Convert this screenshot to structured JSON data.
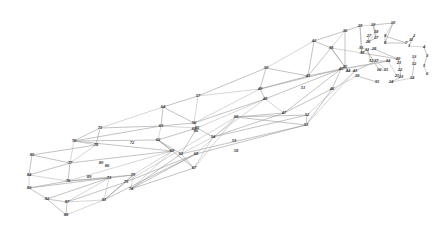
{
  "figure": {
    "background_color": "#ffffff",
    "line_color": "#9a9a9a",
    "label_color": "#2b2b2b"
  },
  "chart_data": {
    "type": "scatter",
    "xlabel": "",
    "ylabel": "",
    "grid": false,
    "legend": "none",
    "xlim": [
      0,
      433
    ],
    "ylim": [
      0,
      236
    ],
    "nodes": [
      {
        "id": "1",
        "x": 409,
        "y": 46
      },
      {
        "id": "2",
        "x": 414,
        "y": 36
      },
      {
        "id": "3",
        "x": 427,
        "y": 56
      },
      {
        "id": "4",
        "x": 424,
        "y": 47
      },
      {
        "id": "5",
        "x": 424,
        "y": 66
      },
      {
        "id": "6",
        "x": 427,
        "y": 74
      },
      {
        "id": "7",
        "x": 406,
        "y": 43
      },
      {
        "id": "8",
        "x": 385,
        "y": 43
      },
      {
        "id": "9",
        "x": 385,
        "y": 36
      },
      {
        "id": "10",
        "x": 393,
        "y": 23
      },
      {
        "id": "11",
        "x": 411,
        "y": 40
      },
      {
        "id": "12",
        "x": 414,
        "y": 64
      },
      {
        "id": "13",
        "x": 414,
        "y": 57
      },
      {
        "id": "14",
        "x": 412,
        "y": 78
      },
      {
        "id": "15",
        "x": 386,
        "y": 70
      },
      {
        "id": "16",
        "x": 379,
        "y": 70
      },
      {
        "id": "17",
        "x": 376,
        "y": 38
      },
      {
        "id": "18",
        "x": 376,
        "y": 32
      },
      {
        "id": "19",
        "x": 373,
        "y": 25
      },
      {
        "id": "20",
        "x": 398,
        "y": 59
      },
      {
        "id": "21",
        "x": 399,
        "y": 63
      },
      {
        "id": "22",
        "x": 400,
        "y": 70
      },
      {
        "id": "23",
        "x": 401,
        "y": 77
      },
      {
        "id": "24",
        "x": 391,
        "y": 82
      },
      {
        "id": "25",
        "x": 397,
        "y": 76
      },
      {
        "id": "26",
        "x": 368,
        "y": 42
      },
      {
        "id": "27",
        "x": 369,
        "y": 36
      },
      {
        "id": "28",
        "x": 374,
        "y": 49
      },
      {
        "id": "29",
        "x": 360,
        "y": 26
      },
      {
        "id": "30",
        "x": 362,
        "y": 53
      },
      {
        "id": "31",
        "x": 367,
        "y": 50
      },
      {
        "id": "32",
        "x": 371,
        "y": 61
      },
      {
        "id": "33",
        "x": 361,
        "y": 48
      },
      {
        "id": "34",
        "x": 388,
        "y": 61
      },
      {
        "id": "35",
        "x": 377,
        "y": 82
      },
      {
        "id": "36",
        "x": 345,
        "y": 31
      },
      {
        "id": "37",
        "x": 376,
        "y": 61
      },
      {
        "id": "38",
        "x": 331,
        "y": 48
      },
      {
        "id": "39",
        "x": 357,
        "y": 76
      },
      {
        "id": "40",
        "x": 341,
        "y": 69
      },
      {
        "id": "41",
        "x": 308,
        "y": 76
      },
      {
        "id": "42",
        "x": 314,
        "y": 41
      },
      {
        "id": "43",
        "x": 355,
        "y": 71
      },
      {
        "id": "44",
        "x": 348,
        "y": 71
      },
      {
        "id": "45",
        "x": 345,
        "y": 67
      },
      {
        "id": "46",
        "x": 332,
        "y": 89
      },
      {
        "id": "47",
        "x": 284,
        "y": 113
      },
      {
        "id": "48",
        "x": 265,
        "y": 99
      },
      {
        "id": "49",
        "x": 260,
        "y": 89
      },
      {
        "id": "50",
        "x": 266,
        "y": 68
      },
      {
        "id": "51",
        "x": 303,
        "y": 88
      },
      {
        "id": "52",
        "x": 307,
        "y": 115
      },
      {
        "id": "53",
        "x": 306,
        "y": 125
      },
      {
        "id": "54",
        "x": 213,
        "y": 137
      },
      {
        "id": "55",
        "x": 197,
        "y": 128
      },
      {
        "id": "56",
        "x": 194,
        "y": 123
      },
      {
        "id": "57",
        "x": 198,
        "y": 96
      },
      {
        "id": "58",
        "x": 236,
        "y": 151
      },
      {
        "id": "59",
        "x": 234,
        "y": 141
      },
      {
        "id": "60",
        "x": 236,
        "y": 117
      },
      {
        "id": "61",
        "x": 181,
        "y": 154
      },
      {
        "id": "62",
        "x": 158,
        "y": 140
      },
      {
        "id": "63",
        "x": 161,
        "y": 126
      },
      {
        "id": "64",
        "x": 163,
        "y": 107
      },
      {
        "id": "65",
        "x": 194,
        "y": 129
      },
      {
        "id": "66",
        "x": 196,
        "y": 131
      },
      {
        "id": "67",
        "x": 194,
        "y": 168
      },
      {
        "id": "68",
        "x": 196,
        "y": 154
      },
      {
        "id": "69",
        "x": 172,
        "y": 151
      },
      {
        "id": "70",
        "x": 74,
        "y": 141
      },
      {
        "id": "71",
        "x": 100,
        "y": 128
      },
      {
        "id": "72",
        "x": 132,
        "y": 143
      },
      {
        "id": "73",
        "x": 109,
        "y": 178
      },
      {
        "id": "74",
        "x": 131,
        "y": 189
      },
      {
        "id": "75",
        "x": 126,
        "y": 182
      },
      {
        "id": "76",
        "x": 68,
        "y": 181
      },
      {
        "id": "77",
        "x": 70,
        "y": 163
      },
      {
        "id": "78",
        "x": 96,
        "y": 145
      },
      {
        "id": "79",
        "x": 133,
        "y": 175
      },
      {
        "id": "80",
        "x": 101,
        "y": 163
      },
      {
        "id": "81",
        "x": 104,
        "y": 200
      },
      {
        "id": "82",
        "x": 47,
        "y": 199
      },
      {
        "id": "83",
        "x": 29,
        "y": 188
      },
      {
        "id": "84",
        "x": 29,
        "y": 175
      },
      {
        "id": "85",
        "x": 32,
        "y": 155
      },
      {
        "id": "86",
        "x": 107,
        "y": 166
      },
      {
        "id": "87",
        "x": 67,
        "y": 202
      },
      {
        "id": "88",
        "x": 66,
        "y": 215
      },
      {
        "id": "89",
        "x": 89,
        "y": 177
      }
    ],
    "node_count": 89,
    "members": [
      [
        "85",
        "78"
      ],
      [
        "78",
        "71"
      ],
      [
        "71",
        "64"
      ],
      [
        "64",
        "57"
      ],
      [
        "57",
        "50"
      ],
      [
        "50",
        "42"
      ],
      [
        "42",
        "36"
      ],
      [
        "36",
        "29"
      ],
      [
        "29",
        "19"
      ],
      [
        "19",
        "10"
      ],
      [
        "84",
        "77"
      ],
      [
        "77",
        "70"
      ],
      [
        "70",
        "63"
      ],
      [
        "63",
        "56"
      ],
      [
        "56",
        "49"
      ],
      [
        "49",
        "41"
      ],
      [
        "41",
        "38"
      ],
      [
        "38",
        "30"
      ],
      [
        "30",
        "20"
      ],
      [
        "83",
        "76"
      ],
      [
        "76",
        "69"
      ],
      [
        "69",
        "62"
      ],
      [
        "62",
        "55"
      ],
      [
        "55",
        "48"
      ],
      [
        "48",
        "40"
      ],
      [
        "40",
        "34"
      ],
      [
        "34",
        "25"
      ],
      [
        "82",
        "73"
      ],
      [
        "73",
        "79"
      ],
      [
        "79",
        "74"
      ],
      [
        "74",
        "67"
      ],
      [
        "67",
        "61"
      ],
      [
        "61",
        "54"
      ],
      [
        "54",
        "47"
      ],
      [
        "47",
        "46"
      ],
      [
        "46",
        "39"
      ],
      [
        "39",
        "35"
      ],
      [
        "88",
        "87"
      ],
      [
        "87",
        "81"
      ],
      [
        "81",
        "75"
      ],
      [
        "75",
        "68"
      ],
      [
        "68",
        "60"
      ],
      [
        "60",
        "53"
      ],
      [
        "53",
        "52"
      ],
      [
        "52",
        "43"
      ],
      [
        "43",
        "37"
      ],
      [
        "85",
        "84"
      ],
      [
        "84",
        "83"
      ],
      [
        "83",
        "82"
      ],
      [
        "82",
        "88"
      ],
      [
        "78",
        "77"
      ],
      [
        "77",
        "76"
      ],
      [
        "76",
        "73"
      ],
      [
        "73",
        "87"
      ],
      [
        "71",
        "70"
      ],
      [
        "70",
        "69"
      ],
      [
        "69",
        "79"
      ],
      [
        "79",
        "81"
      ],
      [
        "64",
        "63"
      ],
      [
        "63",
        "62"
      ],
      [
        "62",
        "61"
      ],
      [
        "61",
        "74"
      ],
      [
        "57",
        "56"
      ],
      [
        "56",
        "55"
      ],
      [
        "55",
        "54"
      ],
      [
        "54",
        "67"
      ],
      [
        "50",
        "49"
      ],
      [
        "49",
        "48"
      ],
      [
        "48",
        "47"
      ],
      [
        "47",
        "60"
      ],
      [
        "42",
        "41"
      ],
      [
        "41",
        "40"
      ],
      [
        "40",
        "46"
      ],
      [
        "46",
        "53"
      ],
      [
        "36",
        "38"
      ],
      [
        "38",
        "45"
      ],
      [
        "45",
        "44"
      ],
      [
        "44",
        "43"
      ],
      [
        "29",
        "30"
      ],
      [
        "30",
        "33"
      ],
      [
        "33",
        "31"
      ],
      [
        "31",
        "32"
      ],
      [
        "19",
        "18"
      ],
      [
        "18",
        "17"
      ],
      [
        "17",
        "26"
      ],
      [
        "26",
        "27"
      ],
      [
        "10",
        "9"
      ],
      [
        "9",
        "8"
      ],
      [
        "8",
        "7"
      ],
      [
        "7",
        "11"
      ],
      [
        "11",
        "2"
      ],
      [
        "2",
        "1"
      ],
      [
        "1",
        "4"
      ],
      [
        "4",
        "3"
      ],
      [
        "3",
        "5"
      ],
      [
        "5",
        "6"
      ],
      [
        "13",
        "12"
      ],
      [
        "12",
        "14"
      ],
      [
        "14",
        "24"
      ],
      [
        "24",
        "23"
      ],
      [
        "23",
        "22"
      ],
      [
        "22",
        "21"
      ],
      [
        "21",
        "20"
      ],
      [
        "20",
        "28"
      ],
      [
        "28",
        "31"
      ],
      [
        "31",
        "16"
      ],
      [
        "16",
        "15"
      ],
      [
        "15",
        "37"
      ],
      [
        "37",
        "34"
      ],
      [
        "85",
        "77"
      ],
      [
        "78",
        "70"
      ],
      [
        "71",
        "63"
      ],
      [
        "64",
        "56"
      ],
      [
        "57",
        "49"
      ],
      [
        "50",
        "41"
      ],
      [
        "42",
        "38"
      ],
      [
        "84",
        "76"
      ],
      [
        "77",
        "69"
      ],
      [
        "70",
        "62"
      ],
      [
        "63",
        "55"
      ],
      [
        "56",
        "48"
      ],
      [
        "49",
        "40"
      ],
      [
        "41",
        "34"
      ],
      [
        "83",
        "73"
      ],
      [
        "76",
        "79"
      ],
      [
        "69",
        "74"
      ],
      [
        "62",
        "67"
      ],
      [
        "55",
        "61"
      ],
      [
        "48",
        "54"
      ],
      [
        "40",
        "47"
      ],
      [
        "82",
        "87"
      ],
      [
        "73",
        "81"
      ],
      [
        "79",
        "75"
      ],
      [
        "74",
        "68"
      ],
      [
        "67",
        "60"
      ],
      [
        "61",
        "53"
      ],
      [
        "54",
        "52"
      ],
      [
        "88",
        "81"
      ],
      [
        "87",
        "75"
      ],
      [
        "81",
        "68"
      ],
      [
        "75",
        "60"
      ],
      [
        "68",
        "53"
      ],
      [
        "60",
        "52"
      ],
      [
        "53",
        "43"
      ],
      [
        "36",
        "45"
      ],
      [
        "38",
        "44"
      ],
      [
        "29",
        "33"
      ],
      [
        "30",
        "31"
      ],
      [
        "19",
        "17"
      ],
      [
        "18",
        "26"
      ],
      [
        "10",
        "8"
      ],
      [
        "9",
        "7"
      ]
    ]
  },
  "labels": {
    "font_style": "italic",
    "items": [
      "1",
      "2",
      "3",
      "4",
      "5",
      "6",
      "7",
      "8",
      "9",
      "10",
      "11",
      "12",
      "13",
      "14",
      "15",
      "16",
      "17",
      "18",
      "19",
      "20",
      "21",
      "22",
      "23",
      "24",
      "25",
      "26",
      "27",
      "28",
      "29",
      "30",
      "31",
      "32",
      "33",
      "34",
      "35",
      "36",
      "37",
      "38",
      "39",
      "40",
      "41",
      "42",
      "43",
      "44",
      "45",
      "46",
      "47",
      "48",
      "49",
      "50",
      "51",
      "52",
      "53",
      "54",
      "55",
      "56",
      "57",
      "58",
      "59",
      "60",
      "61",
      "62",
      "63",
      "64",
      "65",
      "66",
      "67",
      "68",
      "69",
      "70",
      "71",
      "72",
      "73",
      "74",
      "75",
      "76",
      "77",
      "78",
      "79",
      "80",
      "81",
      "82",
      "83",
      "84",
      "85",
      "86",
      "87",
      "88",
      "89"
    ]
  }
}
